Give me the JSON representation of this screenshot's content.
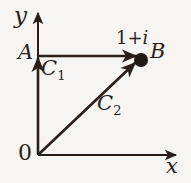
{
  "figure": {
    "kind": "complex-plane-contour-diagram",
    "background_color": "#f7f5f2",
    "ink_color": "#2a1f18",
    "axes": {
      "x_label": "x",
      "y_label": "y",
      "origin_label": "0"
    },
    "points": [
      {
        "id": "A",
        "label": "A",
        "position": "on positive imaginary axis at i"
      },
      {
        "id": "B",
        "label": "B",
        "value_label_plain": "1+i",
        "value_label_real": "1+",
        "value_label_imag": "i",
        "marker": "filled-dot"
      }
    ],
    "paths": [
      {
        "id": "C1",
        "label": "C",
        "subscript": "1",
        "description": "vertical segment 0 to A then horizontal segment A to B"
      },
      {
        "id": "C2",
        "label": "C",
        "subscript": "2",
        "description": "straight diagonal segment 0 to B"
      }
    ]
  }
}
